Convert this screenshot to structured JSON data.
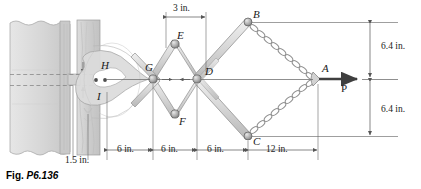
{
  "figure": {
    "caption_prefix": "Fig.",
    "caption_number": "P6.136"
  },
  "points": [
    {
      "id": "A",
      "label": "A",
      "x": 318,
      "y": 79,
      "type": "chain-junction"
    },
    {
      "id": "B",
      "label": "B",
      "x": 248,
      "y": 22,
      "type": "pin-joint"
    },
    {
      "id": "C",
      "label": "C",
      "x": 248,
      "y": 136,
      "type": "pin-joint"
    },
    {
      "id": "D",
      "label": "D",
      "x": 197,
      "y": 79,
      "type": "pin-joint"
    },
    {
      "id": "E",
      "label": "E",
      "x": 175,
      "y": 44,
      "type": "pin-joint"
    },
    {
      "id": "F",
      "label": "F",
      "x": 175,
      "y": 114,
      "type": "pin-joint"
    },
    {
      "id": "G",
      "label": "G",
      "x": 153,
      "y": 79,
      "type": "pin-joint"
    },
    {
      "id": "H",
      "label": "H",
      "x": 101,
      "y": 67,
      "type": "pin-joint"
    },
    {
      "id": "I",
      "label": "I",
      "x": 101,
      "y": 92,
      "type": "pin-joint"
    }
  ],
  "force": {
    "label": "P",
    "applied_at": "A",
    "direction": "right"
  },
  "dimensions": {
    "top": {
      "value": "3 in.",
      "from": "E",
      "to": "D"
    },
    "bottom": [
      {
        "value": "1.5 in."
      },
      {
        "value": "6 in."
      },
      {
        "value": "6 in."
      },
      {
        "value": "6 in."
      },
      {
        "value": "12 in."
      }
    ],
    "right": [
      {
        "value": "6.4 in."
      },
      {
        "value": "6.4 in."
      }
    ]
  },
  "colors": {
    "line": "#3a3a3a",
    "wall_fill": "#d9d9d9",
    "wall_stroke": "#9a9a9a",
    "link_fill": "#dcdcdc",
    "link_stroke": "#8c8c8c",
    "joint_fill": "#b0b0b0",
    "joint_stroke": "#5a5a5a",
    "chain": "#8f8f8f",
    "dim_line": "#6a6a6a",
    "text": "#1a1a1a"
  }
}
